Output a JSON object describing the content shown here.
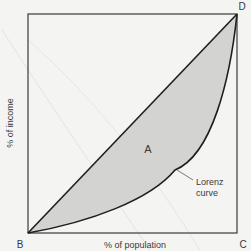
{
  "diagram": {
    "corner_labels": {
      "B": "B",
      "C": "C",
      "D": "D"
    },
    "x_axis_label": "% of population",
    "y_axis_label": "% of income",
    "area_label": "A",
    "curve_label_line1": "Lorenz",
    "curve_label_line2": "curve",
    "colors": {
      "background": "#f4f4f2",
      "frame": "#3a3a3a",
      "curve": "#1e1e1e",
      "shaded_area": "#d3d3d1",
      "leader_line": "#7a7a7a",
      "text": "#3a3a3a"
    }
  }
}
